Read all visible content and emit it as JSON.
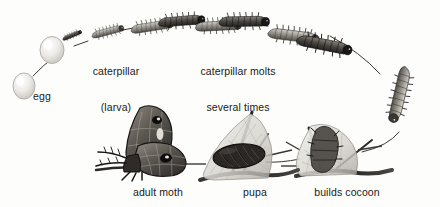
{
  "diagram": {
    "background_color": "#fdfdfc",
    "ink_color": "#1a1a1a",
    "direction": "clockwise-arc-then-right-to-left-along-bottom",
    "medium": "grayscale pen-and-ink / stipple illustration"
  },
  "labels": {
    "egg": "egg",
    "caterpillar_line1": "caterpillar",
    "caterpillar_line2": "(larva)",
    "molts_line1": "caterpillar molts",
    "molts_line2": "several times",
    "adult_moth": "adult moth",
    "pupa": "pupa",
    "builds_cocoon": "builds cocoon"
  },
  "stages": [
    {
      "id": "egg",
      "label": "egg",
      "note": "pale ovoid egg, lower left"
    },
    {
      "id": "hatching-egg",
      "label": "",
      "note": "second egg with newly hatched dark larva emerging"
    },
    {
      "id": "caterpillar-small",
      "label": "caterpillar (larva)",
      "note": "small bristly larva"
    },
    {
      "id": "caterpillar-medium",
      "label": "",
      "note": "larger instar"
    },
    {
      "id": "caterpillar-molting",
      "label": "caterpillar molts several times",
      "note": "instar shedding skin"
    },
    {
      "id": "caterpillar-large",
      "label": "",
      "note": "largest instar with tubercles, top right"
    },
    {
      "id": "caterpillar-descending",
      "label": "",
      "note": "mature caterpillar crawling down right side"
    },
    {
      "id": "builds-cocoon",
      "label": "builds cocoon",
      "note": "caterpillar spinning silk cocoon on twig"
    },
    {
      "id": "pupa",
      "label": "pupa",
      "note": "dark pupa inside finished cocoon on twig"
    },
    {
      "id": "adult-moth",
      "label": "adult moth",
      "note": "emerged adult moth with patterned eyespot wings"
    }
  ]
}
